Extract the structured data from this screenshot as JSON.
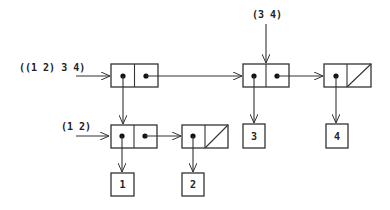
{
  "diagram": {
    "type": "box-and-pointer",
    "labels": {
      "outer_list": "((1 2) 3 4)",
      "tail_list": "(3 4)",
      "inner_list": "(1 2)"
    },
    "atoms": {
      "a1": "1",
      "a2": "2",
      "a3": "3",
      "a4": "4"
    },
    "colors": {
      "stroke": "#333333",
      "background": "#ffffff"
    }
  }
}
